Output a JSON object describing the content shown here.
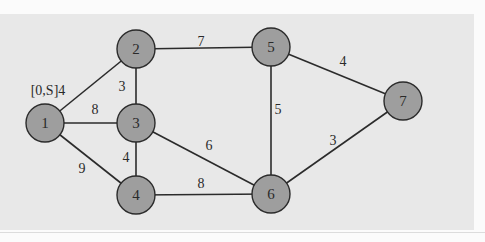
{
  "diagram": {
    "type": "weighted-undirected-graph",
    "colors": {
      "background": "#e8e8e8",
      "node_fill": "#9e9e9e",
      "stroke": "#2b2b2b",
      "text": "#2a2a2a"
    },
    "node_radius": 19,
    "nodes": [
      {
        "id": "1",
        "label": "1",
        "x": 45,
        "y": 123
      },
      {
        "id": "2",
        "label": "2",
        "x": 136,
        "y": 49
      },
      {
        "id": "3",
        "label": "3",
        "x": 136,
        "y": 123
      },
      {
        "id": "4",
        "label": "4",
        "x": 136,
        "y": 195
      },
      {
        "id": "5",
        "label": "5",
        "x": 271,
        "y": 47
      },
      {
        "id": "6",
        "label": "6",
        "x": 271,
        "y": 194
      },
      {
        "id": "7",
        "label": "7",
        "x": 403,
        "y": 101
      }
    ],
    "edges": [
      {
        "from": "1",
        "to": "2",
        "weight": "",
        "label_x": 0,
        "label_y": 0
      },
      {
        "from": "1",
        "to": "3",
        "weight": "8",
        "label_x": 95,
        "label_y": 109
      },
      {
        "from": "1",
        "to": "4",
        "weight": "9",
        "label_x": 82,
        "label_y": 168
      },
      {
        "from": "2",
        "to": "3",
        "weight": "3",
        "label_x": 122,
        "label_y": 86
      },
      {
        "from": "2",
        "to": "5",
        "weight": "7",
        "label_x": 201,
        "label_y": 41
      },
      {
        "from": "3",
        "to": "4",
        "weight": "4",
        "label_x": 126,
        "label_y": 157
      },
      {
        "from": "3",
        "to": "6",
        "weight": "6",
        "label_x": 209,
        "label_y": 145
      },
      {
        "from": "4",
        "to": "6",
        "weight": "8",
        "label_x": 201,
        "label_y": 183
      },
      {
        "from": "5",
        "to": "6",
        "weight": "5",
        "label_x": 278,
        "label_y": 109
      },
      {
        "from": "5",
        "to": "7",
        "weight": "4",
        "label_x": 343,
        "label_y": 61
      },
      {
        "from": "6",
        "to": "7",
        "weight": "3",
        "label_x": 333,
        "label_y": 140
      }
    ],
    "annotations": [
      {
        "text": "[0,S]4",
        "x": 48,
        "y": 90,
        "near_node": "1"
      }
    ]
  }
}
